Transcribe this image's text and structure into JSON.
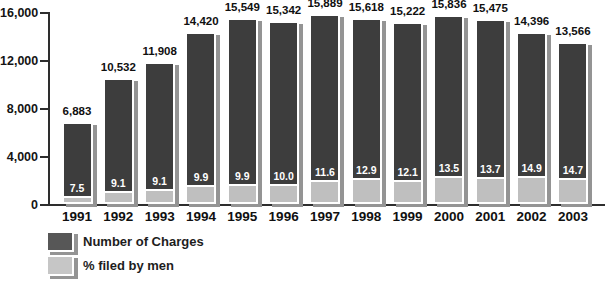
{
  "chart_data": {
    "type": "bar",
    "title": "",
    "xlabel": "",
    "ylabel": "",
    "categories": [
      "1991",
      "1992",
      "1993",
      "1994",
      "1995",
      "1996",
      "1997",
      "1998",
      "1999",
      "2000",
      "2001",
      "2002",
      "2003"
    ],
    "series": [
      {
        "name": "Number of Charges",
        "color": "#3d3d3d",
        "values": [
          6883,
          10532,
          11908,
          14420,
          15549,
          15342,
          15889,
          15618,
          15222,
          15836,
          15475,
          14396,
          13566
        ]
      },
      {
        "name": "% filed by men",
        "color": "#bfbfbf",
        "values": [
          7.5,
          9.1,
          9.1,
          9.9,
          9.9,
          10.0,
          11.6,
          12.9,
          12.1,
          13.5,
          13.7,
          14.9,
          14.7
        ]
      }
    ],
    "value_labels": [
      "6,883",
      "10,532",
      "11,908",
      "14,420",
      "15,549",
      "15,342",
      "15,889",
      "15,618",
      "15,222",
      "15,836",
      "15,475",
      "14,396",
      "13,566"
    ],
    "pct_labels": [
      "7.5",
      "9.1",
      "9.1",
      "9.9",
      "9.9",
      "10.0",
      "11.6",
      "12.9",
      "12.1",
      "13.5",
      "13.7",
      "14.9",
      "14.7"
    ],
    "ylim": [
      0,
      16000
    ],
    "yticks": [
      "16,000",
      "12,000",
      "8,000",
      "4,000",
      "0"
    ],
    "grid": false,
    "legend_position": "bottom-left",
    "note": "Stacked bars: light bottom segment height equals the percent of that year's total charges filed by men"
  },
  "colors": {
    "bar_dark": "#3d3d3d",
    "bar_light": "#bfbfbf",
    "shadow": "#949494",
    "axis": "#2e2e2e",
    "text": "#101010",
    "background": "#ffffff"
  }
}
